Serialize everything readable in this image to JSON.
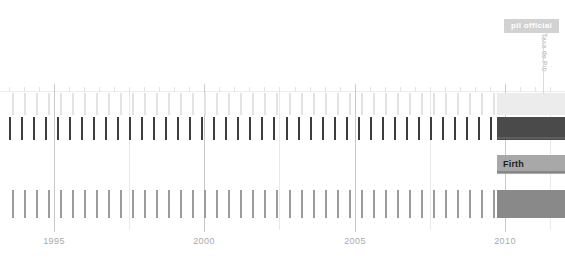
{
  "chart_data": {
    "type": "timeline",
    "title": "",
    "xlabel": "",
    "ylabel": "",
    "xlim": [
      1993.2,
      2012.0
    ],
    "tick_labels": [
      "1995",
      "2000",
      "2005",
      "2010"
    ],
    "tick_values": [
      1995,
      2000,
      2005,
      2010
    ],
    "grid": true,
    "legend": "none",
    "annotations": [
      {
        "text": "pil official",
        "kind": "badge",
        "position": "top-right"
      },
      {
        "text": "Firth",
        "kind": "band-label",
        "position": "row-3-left"
      },
      {
        "text": "Taxa de Pib",
        "kind": "rotated-axis-label",
        "position": "right-edge"
      }
    ],
    "rows": [
      {
        "name": "row-1",
        "color": "#e9e9e9",
        "rug_color": "#e3e3e3",
        "band_color": "#ececec",
        "y": 93,
        "height": 22,
        "rug_values": [
          1993.6,
          1994.0,
          1994.4,
          1994.8,
          1995.2,
          1995.6,
          1996.0,
          1996.4,
          1996.8,
          1997.2,
          1997.6,
          1998.0,
          1998.4,
          1998.8,
          1999.2,
          1999.6,
          2000.0,
          2000.4,
          2000.8,
          2001.2,
          2001.6,
          2002.0,
          2002.4,
          2002.8,
          2003.2,
          2003.6,
          2004.0,
          2004.4,
          2004.8,
          2005.2,
          2005.6,
          2006.0,
          2006.4,
          2006.8,
          2007.2,
          2007.6,
          2008.0,
          2008.4,
          2008.8,
          2009.2,
          2009.6
        ]
      },
      {
        "name": "row-2",
        "color": "#4d4d4d",
        "rug_color": "#3d3d3d",
        "band_color": "#4a4a4a",
        "y": 117,
        "height": 23,
        "rug_values": [
          1993.5,
          1993.9,
          1994.3,
          1994.7,
          1995.1,
          1995.5,
          1995.9,
          1996.3,
          1996.7,
          1997.1,
          1997.5,
          1997.9,
          1998.3,
          1998.7,
          1999.1,
          1999.5,
          1999.9,
          2000.3,
          2000.7,
          2001.1,
          2001.5,
          2001.9,
          2002.3,
          2002.7,
          2003.1,
          2003.5,
          2003.9,
          2004.3,
          2004.7,
          2005.1,
          2005.5,
          2005.9,
          2006.3,
          2006.7,
          2007.1,
          2007.5,
          2007.9,
          2008.3,
          2008.7,
          2009.1,
          2009.5
        ]
      },
      {
        "name": "row-3",
        "color": "#a8a8a8",
        "rug_color": "#ffffff",
        "band_color": "#a8a8a8",
        "y": 155,
        "height": 19,
        "label": "Firth",
        "rug_values": []
      },
      {
        "name": "row-4",
        "color": "#8d8d8d",
        "rug_color": "#9c9c9c",
        "band_color": "#898989",
        "y": 190,
        "height": 28,
        "rug_values": [
          1993.6,
          1994.0,
          1994.4,
          1994.8,
          1995.2,
          1995.6,
          1996.0,
          1996.4,
          1996.8,
          1997.2,
          1997.6,
          1998.0,
          1998.4,
          1998.8,
          1999.2,
          1999.6,
          2000.0,
          2000.4,
          2000.8,
          2001.2,
          2001.6,
          2002.0,
          2002.4,
          2002.8,
          2003.2,
          2003.6,
          2004.0,
          2004.4,
          2004.8,
          2005.2,
          2005.6,
          2006.0,
          2006.4,
          2006.8,
          2007.2,
          2007.6,
          2008.0,
          2008.4,
          2008.8,
          2009.2,
          2009.6
        ]
      }
    ],
    "minor_tick_values": [
      1993.5,
      1994.0,
      1994.5,
      1995.0,
      1995.5,
      1996.0,
      1996.5,
      1997.0,
      1997.5,
      1998.0,
      1998.5,
      1999.0,
      1999.5,
      2000.0,
      2000.5,
      2001.0,
      2001.5,
      2002.0,
      2002.5,
      2003.0,
      2003.5,
      2004.0,
      2004.5,
      2005.0,
      2005.5,
      2006.0,
      2006.5,
      2007.0,
      2007.5,
      2008.0,
      2008.5,
      2009.0,
      2009.5,
      2010.0,
      2010.5,
      2011.0,
      2011.5
    ],
    "panel_start_value": 2009.75,
    "colors": {
      "grid": "#d7d7d7",
      "axis_text": "#a9a9a9",
      "badge_bg": "#d2d2d2",
      "badge_text": "#ffffff",
      "band_label_text": "#1d1d1d"
    }
  }
}
